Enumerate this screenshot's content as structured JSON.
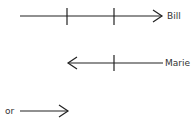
{
  "arrows": [
    {
      "label": "Bill",
      "direction": "right",
      "ticks": 2
    },
    {
      "label": "Marie",
      "direction": "left",
      "ticks": 1
    },
    {
      "label": "or",
      "direction": "right",
      "ticks": 0
    }
  ],
  "colors": {
    "stroke": "#222222",
    "text": "#333333"
  }
}
